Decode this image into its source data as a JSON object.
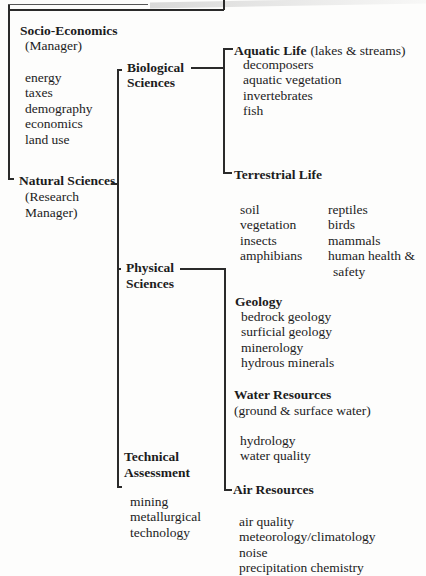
{
  "diagram": {
    "root": {
      "children": [
        {
          "title": "Socio-Economics",
          "role": "(Manager)",
          "items": [
            "energy",
            "taxes",
            "demography",
            "economics",
            "land use"
          ]
        },
        {
          "title": "Natural Sciences",
          "role_line1": "(Research",
          "role_line2": "Manager)",
          "children": [
            {
              "title_line1": "Biological",
              "title_line2": "Sciences",
              "children": [
                {
                  "title": "Aquatic Life",
                  "subtitle": "(lakes & streams)",
                  "items": [
                    "decomposers",
                    "aquatic vegetation",
                    "invertebrates",
                    "fish"
                  ]
                },
                {
                  "title": "Terrestrial Life",
                  "items_col1": [
                    "soil",
                    "vegetation",
                    "insects",
                    "amphibians"
                  ],
                  "items_col2": [
                    "reptiles",
                    "birds",
                    "mammals",
                    "human health &"
                  ],
                  "items_col2_cont": "safety"
                }
              ]
            },
            {
              "title_line1": "Physical",
              "title_line2": "Sciences",
              "children": [
                {
                  "title": "Geology",
                  "items": [
                    "bedrock geology",
                    "surficial geology",
                    "minerology",
                    "hydrous minerals"
                  ]
                },
                {
                  "title": "Water Resources",
                  "subtitle": "(ground & surface water)",
                  "items": [
                    "hydrology",
                    "water quality"
                  ]
                },
                {
                  "title": "Air Resources",
                  "items": [
                    "air quality",
                    "meteorology/climatology",
                    "noise",
                    "precipitation chemistry"
                  ]
                }
              ]
            },
            {
              "title_line1": "Technical",
              "title_line2": "Assessment",
              "items": [
                "mining",
                "metallurgical",
                "technology"
              ]
            }
          ]
        }
      ]
    }
  }
}
